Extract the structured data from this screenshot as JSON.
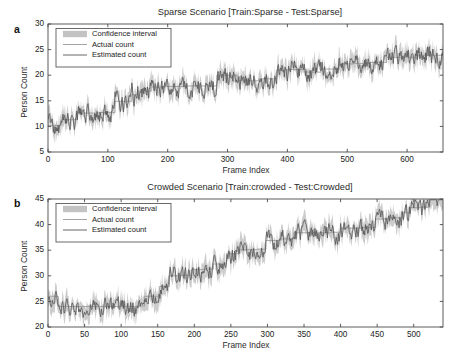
{
  "figure": {
    "background": "#ffffff",
    "panel_letters": [
      "a",
      "b"
    ]
  },
  "legend": {
    "entries": [
      {
        "label": "Confidence interval",
        "type": "band",
        "color": "#c3c3c3"
      },
      {
        "label": "Actual count",
        "type": "line",
        "color": "#9a9a9a"
      },
      {
        "label": "Estimated count",
        "type": "line",
        "color": "#555555"
      }
    ]
  },
  "chart_data": [
    {
      "id": "panel-a",
      "letter": "a",
      "type": "line",
      "title": "Sparse Scenario [Train:Sparse - Test:Sparse]",
      "xlabel": "Frame Index",
      "ylabel": "Person Count",
      "xlim": [
        0,
        660
      ],
      "ylim": [
        5,
        30
      ],
      "xticks": [
        0,
        100,
        200,
        300,
        400,
        500,
        600
      ],
      "yticks": [
        5,
        10,
        15,
        20,
        25,
        30
      ],
      "grid": false,
      "legend_position": "upper-left",
      "series": [
        {
          "name": "Actual count",
          "style": "step",
          "color": "#9a9a9a",
          "x": [
            0,
            22,
            48,
            88,
            112,
            140,
            150,
            172,
            196,
            232,
            256,
            282,
            316,
            352,
            382,
            404,
            432,
            456,
            486,
            510,
            538,
            566,
            594,
            618,
            660
          ],
          "values": [
            10.2,
            11.3,
            12.6,
            12.7,
            14.9,
            16.2,
            16.9,
            17.7,
            17.8,
            17.9,
            17.9,
            20.0,
            18.9,
            19.3,
            21.0,
            21.1,
            20.6,
            21.2,
            22.2,
            22.3,
            22.5,
            23.5,
            23.5,
            23.9,
            23.9
          ]
        },
        {
          "name": "Estimated count",
          "style": "noisy",
          "color": "#555555",
          "noise_amplitude": 1.55,
          "seed": 1871,
          "n_points": 660,
          "baseline_from": "Actual count"
        }
      ],
      "confidence_interval": {
        "name": "Confidence interval",
        "color": "#c3c3c3",
        "half_width": 1.45,
        "around": "Estimated count"
      }
    },
    {
      "id": "panel-b",
      "letter": "b",
      "type": "line",
      "title": "Crowded Scenario [Train:crowded - Test:Crowded]",
      "xlabel": "Frame Index",
      "ylabel": "Person Count",
      "xlim": [
        0,
        540
      ],
      "ylim": [
        20,
        45
      ],
      "xticks": [
        0,
        50,
        100,
        150,
        200,
        250,
        300,
        350,
        400,
        450,
        500
      ],
      "yticks": [
        20,
        25,
        30,
        35,
        40,
        45
      ],
      "grid": false,
      "legend_position": "upper-left",
      "series": [
        {
          "name": "Actual count",
          "style": "step",
          "color": "#9a9a9a",
          "x": [
            0,
            14,
            120,
            132,
            152,
            166,
            182,
            196,
            214,
            226,
            244,
            262,
            286,
            298,
            318,
            336,
            388,
            400,
            428,
            448,
            466,
            484,
            494,
            508,
            522,
            540
          ],
          "values": [
            26.0,
            24.0,
            24.1,
            26.0,
            27.9,
            30.0,
            30.1,
            31.2,
            31.3,
            32.3,
            34.3,
            35.1,
            35.2,
            36.9,
            37.2,
            38.4,
            38.5,
            39.3,
            39.4,
            41.1,
            41.3,
            42.3,
            43.3,
            43.4,
            45.0,
            45.1
          ]
        },
        {
          "name": "Estimated count",
          "style": "noisy",
          "color": "#555555",
          "noise_amplitude": 1.65,
          "seed": 2903,
          "n_points": 540,
          "baseline_from": "Actual count"
        }
      ],
      "confidence_interval": {
        "name": "Confidence interval",
        "color": "#c3c3c3",
        "half_width": 1.5,
        "around": "Estimated count"
      }
    }
  ]
}
